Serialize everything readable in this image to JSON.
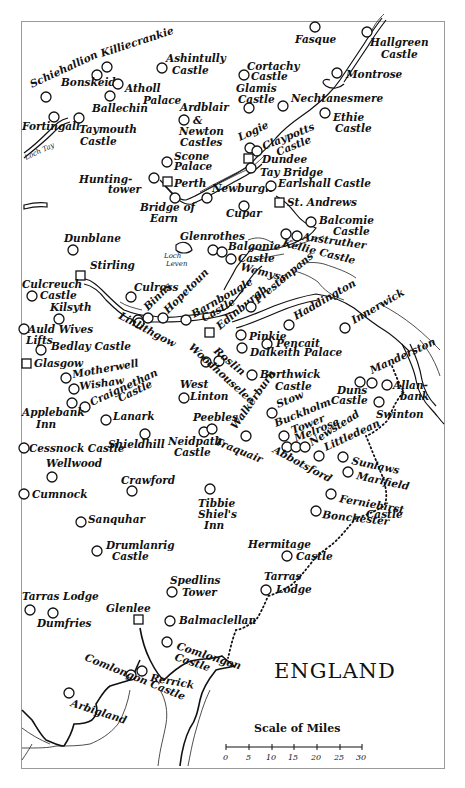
{
  "map": {
    "country_label": "ENGLAND",
    "scale": {
      "title": "Scale of Miles",
      "ticks": [
        "0",
        "5",
        "10",
        "15",
        "20",
        "25",
        "30"
      ]
    },
    "water_labels": [
      "Loch Tay",
      "Loch Leven"
    ],
    "places": [
      {
        "name": "Schiehallion",
        "type": "site"
      },
      {
        "name": "Killiecrankie",
        "type": "site"
      },
      {
        "name": "Bonskeid",
        "type": "site"
      },
      {
        "name": "Atholl Palace",
        "type": "site"
      },
      {
        "name": "Ballechin",
        "type": "site"
      },
      {
        "name": "Ashintully Castle",
        "type": "site"
      },
      {
        "name": "Fortingall",
        "type": "site"
      },
      {
        "name": "Taymouth Castle",
        "type": "site"
      },
      {
        "name": "Fasque",
        "type": "site"
      },
      {
        "name": "Hallgreen Castle",
        "type": "site"
      },
      {
        "name": "Cortachy Castle",
        "type": "site"
      },
      {
        "name": "Montrose",
        "type": "site"
      },
      {
        "name": "Glamis Castle",
        "type": "site"
      },
      {
        "name": "Nechtanesmere",
        "type": "site"
      },
      {
        "name": "Ethie Castle",
        "type": "site"
      },
      {
        "name": "Ardblair & Newton Castles",
        "type": "site"
      },
      {
        "name": "Logie",
        "type": "site"
      },
      {
        "name": "Claypotts Castle",
        "type": "site"
      },
      {
        "name": "Dundee",
        "type": "town"
      },
      {
        "name": "Scone Palace",
        "type": "site"
      },
      {
        "name": "Tay Bridge",
        "type": "site"
      },
      {
        "name": "Huntingtower",
        "type": "site"
      },
      {
        "name": "Perth",
        "type": "town"
      },
      {
        "name": "Newburgh",
        "type": "site"
      },
      {
        "name": "Earlshall Castle",
        "type": "site"
      },
      {
        "name": "St. Andrews",
        "type": "town"
      },
      {
        "name": "Bridge of Earn",
        "type": "site"
      },
      {
        "name": "Cupar",
        "type": "site"
      },
      {
        "name": "Balcomie Castle",
        "type": "site"
      },
      {
        "name": "Dunblane",
        "type": "site"
      },
      {
        "name": "Glenrothes",
        "type": "site"
      },
      {
        "name": "Balgonie Castle",
        "type": "site"
      },
      {
        "name": "Kellie Castle",
        "type": "site"
      },
      {
        "name": "Anstruther",
        "type": "site"
      },
      {
        "name": "Wemyss",
        "type": "site"
      },
      {
        "name": "Stirling",
        "type": "town"
      },
      {
        "name": "Culross",
        "type": "site"
      },
      {
        "name": "Culcreuch Castle",
        "type": "site"
      },
      {
        "name": "Binns",
        "type": "site"
      },
      {
        "name": "Hopetoun",
        "type": "site"
      },
      {
        "name": "Barnbougle Castle",
        "type": "site"
      },
      {
        "name": "Edinburgh",
        "type": "town"
      },
      {
        "name": "Prestonpans",
        "type": "site"
      },
      {
        "name": "Haddington",
        "type": "site"
      },
      {
        "name": "Innerwick",
        "type": "site"
      },
      {
        "name": "Kilsyth",
        "type": "site"
      },
      {
        "name": "Linlithgow",
        "type": "site"
      },
      {
        "name": "Auld Wives Lifts",
        "type": "site"
      },
      {
        "name": "Pinkie",
        "type": "site"
      },
      {
        "name": "Pencait",
        "type": "site"
      },
      {
        "name": "Dalkeith Palace",
        "type": "site"
      },
      {
        "name": "Bedlay Castle",
        "type": "site"
      },
      {
        "name": "Glasgow",
        "type": "town"
      },
      {
        "name": "Roslin",
        "type": "site"
      },
      {
        "name": "Woodhouselee",
        "type": "site"
      },
      {
        "name": "Motherwell",
        "type": "site"
      },
      {
        "name": "Wishaw",
        "type": "site"
      },
      {
        "name": "Craignethan Castle",
        "type": "site"
      },
      {
        "name": "West Linton",
        "type": "site"
      },
      {
        "name": "Borthwick Castle",
        "type": "site"
      },
      {
        "name": "Manderston",
        "type": "site"
      },
      {
        "name": "Applebank Inn",
        "type": "site"
      },
      {
        "name": "Lanark",
        "type": "site"
      },
      {
        "name": "Peebles",
        "type": "site"
      },
      {
        "name": "Walkerburn",
        "type": "site"
      },
      {
        "name": "Stow",
        "type": "site"
      },
      {
        "name": "Duns Castle",
        "type": "site"
      },
      {
        "name": "Allanbank",
        "type": "site"
      },
      {
        "name": "Swinton",
        "type": "site"
      },
      {
        "name": "Cessnock Castle",
        "type": "site"
      },
      {
        "name": "Shieldhill",
        "type": "site"
      },
      {
        "name": "Neidpath Castle",
        "type": "site"
      },
      {
        "name": "Traquair",
        "type": "site"
      },
      {
        "name": "Buckholm Tower",
        "type": "site"
      },
      {
        "name": "Melrose",
        "type": "site"
      },
      {
        "name": "Newstead",
        "type": "site"
      },
      {
        "name": "Littledean",
        "type": "site"
      },
      {
        "name": "Abbotsford",
        "type": "site"
      },
      {
        "name": "Sunlaws",
        "type": "site"
      },
      {
        "name": "Marlfield",
        "type": "site"
      },
      {
        "name": "Wellwood",
        "type": "site"
      },
      {
        "name": "Crawford",
        "type": "site"
      },
      {
        "name": "Cumnock",
        "type": "site"
      },
      {
        "name": "Tibbie Shiel's Inn",
        "type": "site"
      },
      {
        "name": "Ferniehirst Castle",
        "type": "site"
      },
      {
        "name": "Bonchester",
        "type": "site"
      },
      {
        "name": "Sanquhar",
        "type": "site"
      },
      {
        "name": "Drumlanrig Castle",
        "type": "site"
      },
      {
        "name": "Hermitage Castle",
        "type": "site"
      },
      {
        "name": "Spedlins Tower",
        "type": "site"
      },
      {
        "name": "Tarras Lodge",
        "type": "site"
      },
      {
        "name": "Glenlee",
        "type": "site"
      },
      {
        "name": "Dumfries",
        "type": "town"
      },
      {
        "name": "Balmaclellan",
        "type": "site"
      },
      {
        "name": "Rammerscales",
        "type": "site"
      },
      {
        "name": "Comlongon Castle",
        "type": "site"
      },
      {
        "name": "Rerrick",
        "type": "site"
      },
      {
        "name": "Arbigland",
        "type": "site"
      },
      {
        "name": "Kilcormack",
        "type": "site"
      }
    ]
  }
}
